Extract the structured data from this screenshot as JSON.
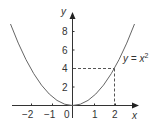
{
  "figure": {
    "function_label": "y = x",
    "function_exponent": "2",
    "x_axis_label": "x",
    "y_axis_label": "y",
    "x_ticks": [
      "−2",
      "−1",
      "0",
      "1",
      "2"
    ],
    "y_ticks": [
      "2",
      "4",
      "6",
      "8"
    ],
    "highlight_point": {
      "x": 2,
      "y": 4
    },
    "colors": {
      "curve": "#666666",
      "axis": "#333333",
      "dashed": "#555555"
    }
  }
}
